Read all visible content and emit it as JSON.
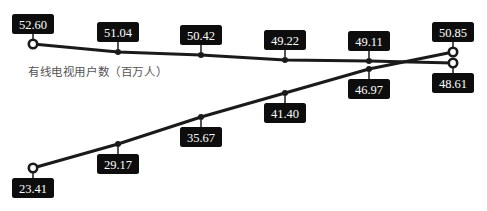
{
  "chart_data": {
    "type": "line",
    "title": "",
    "xlabel": "",
    "ylabel": "",
    "categories": [
      "1",
      "2",
      "3",
      "4",
      "5",
      "6"
    ],
    "annotations": [
      "有线电视用户数（百万人）"
    ],
    "grid": false,
    "legend": "none",
    "series": [
      {
        "name": "有线电视用户数（百万人）",
        "values": [
          52.6,
          51.04,
          50.42,
          49.22,
          49.11,
          48.61
        ],
        "labels": [
          "52.60",
          "51.04",
          "50.42",
          "49.22",
          "49.11",
          "48.61"
        ]
      },
      {
        "name": "series-2",
        "values": [
          23.41,
          29.17,
          35.67,
          41.4,
          46.97,
          50.85
        ],
        "labels": [
          "23.41",
          "29.17",
          "35.67",
          "41.40",
          "46.97",
          "50.85"
        ]
      }
    ],
    "colors": {
      "line": "#1a1a1a",
      "label_bg": "#0d0d0d",
      "label_text": "#ffffff",
      "annotation": "#555555"
    }
  },
  "annotation": {
    "text": "有线电视用户数（百万人）"
  }
}
